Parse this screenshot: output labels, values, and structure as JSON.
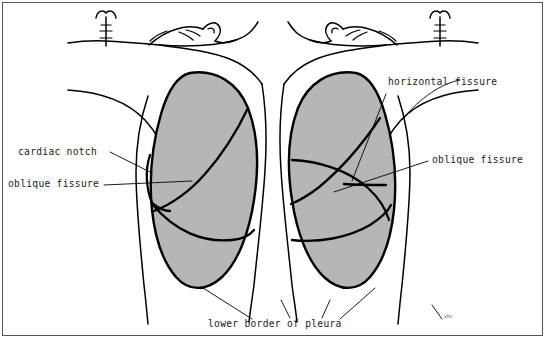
{
  "figure": {
    "background_color": "#ffffff",
    "frame_color": "#555555",
    "ink_color": "#000000",
    "lung_fill_color": "#b6b6b6",
    "view_left": "anterior thoracic wall, left side of drawing",
    "view_right": "anterior thoracic wall, right side of drawing",
    "signature": "vhc"
  },
  "labels": {
    "cardiac_notch": "cardiac notch",
    "oblique_fissure_left": "oblique fissure",
    "horizontal_fissure": "horizontal fissure",
    "oblique_fissure_right": "oblique fissure",
    "lower_border_of_pleura": "lower border of pleura"
  },
  "label_positions": {
    "cardiac_notch": {
      "x": 18,
      "y": 155
    },
    "oblique_fissure_left": {
      "x": 8,
      "y": 187
    },
    "horizontal_fissure": {
      "x": 388,
      "y": 85
    },
    "oblique_fissure_right": {
      "x": 432,
      "y": 163
    },
    "lower_border_of_pleura": {
      "x": 208,
      "y": 327
    },
    "signature": {
      "x": 443,
      "y": 316
    }
  },
  "structures": [
    {
      "name": "left-lung-lobes",
      "count": 2,
      "lobes": [
        "superior lobe",
        "inferior lobe"
      ]
    },
    {
      "name": "right-lung-lobes",
      "count": 3,
      "lobes": [
        "superior lobe",
        "middle lobe",
        "inferior lobe"
      ]
    },
    {
      "name": "trachea",
      "side": "both"
    },
    {
      "name": "clavicle",
      "side": "both"
    },
    {
      "name": "neck-and-head-profile",
      "side": "both"
    },
    {
      "name": "pleural-outline",
      "side": "both"
    }
  ]
}
